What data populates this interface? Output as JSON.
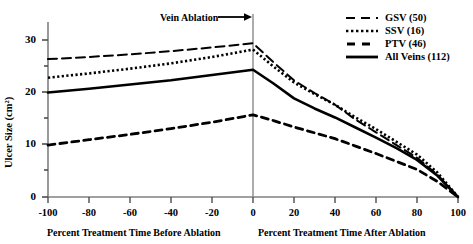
{
  "chart_data": {
    "type": "line",
    "title": "",
    "xlabel_left": "Percent Treatment Time Before Ablation",
    "xlabel_right": "Percent Treatment Time After Ablation",
    "ylabel": "Ulcer Size (cm²)",
    "xlim": [
      -100,
      100
    ],
    "ylim": [
      0,
      33
    ],
    "xticks": [
      -100,
      -80,
      -60,
      -40,
      -20,
      0,
      20,
      40,
      60,
      80,
      100
    ],
    "xticklabels": [
      "-100",
      "-80",
      "-60",
      "-40",
      "-20",
      "0",
      "20",
      "40",
      "60",
      "80",
      "100"
    ],
    "yticks": [
      0,
      10,
      20,
      30
    ],
    "yticklabels": [
      "0",
      "10",
      "20",
      "30"
    ],
    "yminorticks": [
      5,
      15,
      25
    ],
    "grid": false,
    "legend_position": "top-right",
    "annotations": [
      {
        "text": "Vein Ablation",
        "arrow": "→",
        "x": 0,
        "note": "vertical reference line at x = 0"
      }
    ],
    "vline": {
      "x": 0,
      "color": "#808080"
    },
    "x": [
      -100,
      -80,
      -60,
      -40,
      -20,
      0,
      10,
      20,
      30,
      40,
      50,
      60,
      70,
      80,
      90,
      100
    ],
    "series": [
      {
        "name": "GSV (50)",
        "count": 50,
        "style": "long-dash",
        "color": "#000000",
        "values": [
          26.0,
          26.4,
          26.9,
          27.5,
          28.2,
          29.0,
          25.4,
          22.0,
          19.6,
          17.4,
          14.6,
          12.2,
          9.8,
          7.4,
          4.2,
          0.0
        ]
      },
      {
        "name": "SSV (16)",
        "count": 16,
        "style": "dotted",
        "color": "#000000",
        "values": [
          22.5,
          23.3,
          24.2,
          25.2,
          26.4,
          27.8,
          24.6,
          21.6,
          19.4,
          17.4,
          15.0,
          12.8,
          10.4,
          8.0,
          4.6,
          0.0
        ]
      },
      {
        "name": "PTV (46)",
        "count": 46,
        "style": "dash",
        "color": "#000000",
        "values": [
          9.8,
          10.8,
          11.8,
          12.9,
          14.1,
          15.5,
          14.4,
          13.2,
          12.1,
          11.0,
          9.6,
          8.2,
          6.7,
          5.2,
          2.9,
          0.0
        ]
      },
      {
        "name": "All Veins (112)",
        "count": 112,
        "style": "solid",
        "color": "#000000",
        "values": [
          19.7,
          20.4,
          21.2,
          22.0,
          23.0,
          24.0,
          21.4,
          18.6,
          16.7,
          15.0,
          13.1,
          11.2,
          9.2,
          7.0,
          4.0,
          0.0
        ]
      }
    ]
  },
  "axes": {
    "y_title": "Ulcer Size (cm²)",
    "x_title_left": "Percent Treatment Time Before Ablation",
    "x_title_right": "Percent Treatment Time After Ablation"
  },
  "annotation": {
    "ablation_label": "Vein Ablation",
    "ablation_arrow": "⟶"
  },
  "legend": {
    "entries": [
      {
        "label": "GSV (50)"
      },
      {
        "label": "SSV (16)"
      },
      {
        "label": "PTV (46)"
      },
      {
        "label": "All Veins (112)"
      }
    ]
  }
}
